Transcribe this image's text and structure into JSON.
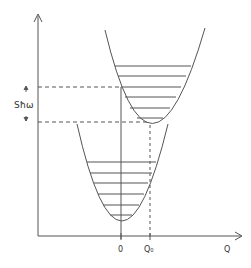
{
  "diagram": {
    "type": "configuration-coordinate-diagram",
    "x_axis": {
      "label": "Q",
      "ticks": [
        "0",
        "Q₀"
      ]
    },
    "y_axis": {
      "label": ""
    },
    "energy_gap_label": "ħω",
    "energy_gap_prefix": "S",
    "colors": {
      "line": "#555555",
      "background": "#ffffff"
    },
    "upper_parabola": {
      "vertex_tick": "Q₀",
      "levels": 6
    },
    "lower_parabola": {
      "vertex_tick": "0",
      "levels": 6
    }
  }
}
